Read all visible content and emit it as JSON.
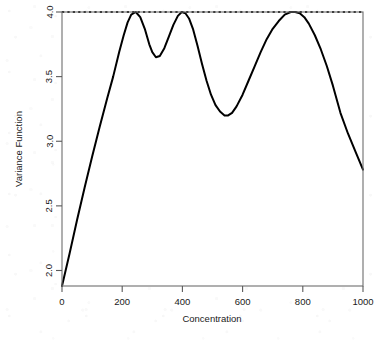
{
  "chart_data": {
    "type": "line",
    "title": "",
    "xlabel": "Concentration",
    "ylabel": "Variance Function",
    "xlim": [
      0,
      1000
    ],
    "ylim": [
      1.88,
      4.0
    ],
    "xticks": [
      0,
      200,
      400,
      600,
      800,
      1000
    ],
    "xtick_labels": [
      "0",
      "200",
      "400",
      "600",
      "800",
      "1000"
    ],
    "yticks": [
      2.0,
      2.5,
      3.0,
      3.5,
      4.0
    ],
    "ytick_labels": [
      "2.0",
      "2.5",
      "3.0",
      "3.5",
      "4.0"
    ],
    "grid": false,
    "legend": null,
    "box": true,
    "series": [
      {
        "name": "Variance Function",
        "style": "solid",
        "color": "#000000",
        "linewidth": 2,
        "x": [
          0,
          25,
          50,
          75,
          100,
          125,
          150,
          170,
          190,
          205,
          218,
          230,
          245,
          260,
          275,
          290,
          300,
          312,
          325,
          340,
          355,
          370,
          385,
          398,
          410,
          422,
          435,
          450,
          465,
          480,
          495,
          510,
          525,
          540,
          552,
          565,
          580,
          600,
          620,
          640,
          660,
          680,
          700,
          720,
          740,
          760,
          775,
          790,
          805,
          820,
          840,
          860,
          880,
          900,
          925,
          950,
          975,
          1000
        ],
        "y": [
          1.88,
          2.13,
          2.39,
          2.64,
          2.88,
          3.11,
          3.33,
          3.5,
          3.69,
          3.82,
          3.92,
          3.98,
          4.0,
          3.96,
          3.87,
          3.75,
          3.69,
          3.65,
          3.66,
          3.72,
          3.81,
          3.9,
          3.97,
          4.0,
          3.99,
          3.95,
          3.87,
          3.74,
          3.6,
          3.47,
          3.36,
          3.28,
          3.23,
          3.2,
          3.2,
          3.22,
          3.27,
          3.36,
          3.47,
          3.58,
          3.69,
          3.79,
          3.87,
          3.93,
          3.98,
          4.0,
          4.0,
          3.99,
          3.96,
          3.91,
          3.82,
          3.71,
          3.58,
          3.43,
          3.22,
          3.06,
          2.92,
          2.78
        ]
      },
      {
        "name": "upper bound",
        "style": "dotted",
        "color": "#000000",
        "linewidth": 2,
        "x": [
          0,
          1000
        ],
        "y": [
          4.0,
          4.0
        ]
      }
    ],
    "annotations": [
      {
        "label": "maximum variance reference line",
        "value": 4.0,
        "orientation": "horizontal",
        "style": "dotted"
      }
    ],
    "features": {
      "start_value": 1.88,
      "end_value": 2.78,
      "local_maxima": [
        {
          "x": 245,
          "y": 4.0
        },
        {
          "x": 398,
          "y": 4.0
        },
        {
          "x": 765,
          "y": 4.0
        }
      ],
      "local_minima": [
        {
          "x": 312,
          "y": 3.65
        },
        {
          "x": 545,
          "y": 3.2
        }
      ]
    }
  },
  "colors": {
    "line": "#000000",
    "axis": "#5a5a5a",
    "text": "#1a1a1a",
    "background": "#ffffff"
  }
}
